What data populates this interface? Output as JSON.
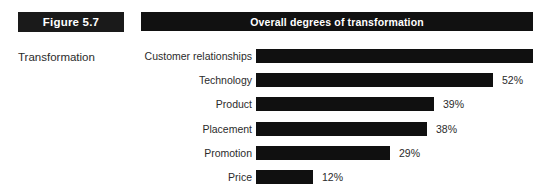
{
  "figure": {
    "badge_label": "Figure 5.7",
    "caption": "Transformation"
  },
  "chart_header": {
    "title": "Overall degrees of transformation"
  },
  "colors": {
    "bar": "#101010",
    "header_bar": "#111111",
    "badge": "#1a1a1a",
    "text": "#2b2b2b",
    "background": "#ffffff"
  },
  "chart_data": {
    "type": "bar",
    "orientation": "horizontal",
    "title": "Overall degrees of transformation",
    "xlabel": "",
    "ylabel": "",
    "xlim": [
      0,
      75
    ],
    "grid": false,
    "legend": null,
    "categories": [
      "Customer relationships",
      "Technology",
      "Product",
      "Placement",
      "Promotion",
      "Price"
    ],
    "values": [
      75,
      52,
      39,
      38,
      29,
      12
    ],
    "value_labels": [
      "",
      "52%",
      "39%",
      "38%",
      "29%",
      "12%"
    ],
    "bars": [
      {
        "category": "Customer relationships",
        "value": 75,
        "label": "",
        "bar_px": 277
      },
      {
        "category": "Technology",
        "value": 52,
        "label": "52%",
        "bar_px": 237
      },
      {
        "category": "Product",
        "value": 39,
        "label": "39%",
        "bar_px": 178
      },
      {
        "category": "Placement",
        "value": 38,
        "label": "38%",
        "bar_px": 171
      },
      {
        "category": "Promotion",
        "value": 29,
        "label": "29%",
        "bar_px": 134
      },
      {
        "category": "Price",
        "value": 12,
        "label": "12%",
        "bar_px": 57
      }
    ],
    "row_tops_px": [
      12,
      36,
      60,
      85,
      109,
      133
    ]
  }
}
